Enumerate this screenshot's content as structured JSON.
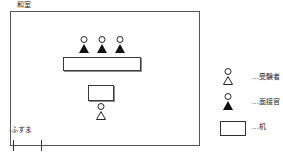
{
  "diagram": {
    "room_label": "和室",
    "door_label": "ふすま",
    "room": {
      "interviewers_count": 3,
      "examinees_count": 1,
      "desks_count": 2
    },
    "legend": {
      "items": [
        {
          "icon": "person-outline-icon",
          "label": "…受験者"
        },
        {
          "icon": "person-filled-icon",
          "label": "…面接官"
        },
        {
          "icon": "desk-rectangle-icon",
          "label": "…机"
        }
      ]
    },
    "colors": {
      "wall": "#555555",
      "figure": "#222222",
      "desk_outline": "#3a3a3a",
      "background": "#ffffff"
    }
  }
}
